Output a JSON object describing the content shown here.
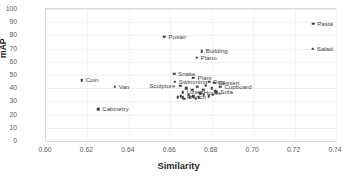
{
  "chart_data": {
    "type": "scatter",
    "title": "",
    "xlabel": "Similarity",
    "ylabel": "mAP",
    "xlim": [
      0.6,
      0.74
    ],
    "ylim": [
      0,
      100
    ],
    "xticks": [
      "0.60",
      "0.62",
      "0.64",
      "0.66",
      "0.68",
      "0.70",
      "0.72",
      "0.74"
    ],
    "xtick_values": [
      0.6,
      0.62,
      0.64,
      0.66,
      0.68,
      0.7,
      0.72,
      0.74
    ],
    "yticks": [
      "0",
      "10",
      "20",
      "30",
      "40",
      "50",
      "60",
      "70",
      "80",
      "90",
      "100"
    ],
    "ytick_values": [
      0,
      10,
      20,
      30,
      40,
      50,
      60,
      70,
      80,
      90,
      100
    ],
    "grid": true,
    "legend": "none",
    "marker_color": "#3f3f3f",
    "points": [
      {
        "label": "Pasta",
        "x": 0.729,
        "y": 89,
        "lx": 4,
        "ly": 0
      },
      {
        "label": "Salad",
        "x": 0.7288,
        "y": 70,
        "lx": 4,
        "ly": 0
      },
      {
        "label": "Poster",
        "x": 0.6572,
        "y": 79,
        "lx": 4,
        "ly": 0
      },
      {
        "label": "Building",
        "x": 0.6752,
        "y": 68,
        "lx": 4,
        "ly": 0
      },
      {
        "label": "Piano",
        "x": 0.6728,
        "y": 63,
        "lx": 4,
        "ly": 0
      },
      {
        "label": "Snake",
        "x": 0.6618,
        "y": 51,
        "lx": 4,
        "ly": 0
      },
      {
        "label": "Coin",
        "x": 0.6172,
        "y": 46,
        "lx": 4,
        "ly": 0
      },
      {
        "label": "Plant",
        "x": 0.6712,
        "y": 48,
        "lx": 4,
        "ly": 0
      },
      {
        "label": "Swimming",
        "x": 0.6622,
        "y": 45,
        "lx": 4,
        "ly": 0
      },
      {
        "label": "Dog",
        "x": 0.6788,
        "y": 45,
        "lx": 4,
        "ly": 0
      },
      {
        "label": "Dessert",
        "x": 0.6812,
        "y": 44,
        "lx": 4,
        "ly": 0
      },
      {
        "label": "Sculpture",
        "x": 0.6648,
        "y": 42,
        "lx": -31,
        "ly": 0
      },
      {
        "label": "Van",
        "x": 0.6332,
        "y": 41,
        "lx": 4,
        "ly": 0
      },
      {
        "label": "Cupboard",
        "x": 0.6842,
        "y": 41,
        "lx": 4,
        "ly": 0
      },
      {
        "label": "Lizard",
        "x": 0.666,
        "y": 37,
        "lx": 4,
        "ly": 0
      },
      {
        "label": "House",
        "x": 0.6742,
        "y": 36,
        "lx": 4,
        "ly": 0
      },
      {
        "label": "Sofa",
        "x": 0.6822,
        "y": 37,
        "lx": 4,
        "ly": 0
      },
      {
        "label": "French",
        "x": 0.666,
        "y": 33,
        "lx": 4,
        "ly": 0
      },
      {
        "label": "Cabinetry",
        "x": 0.6252,
        "y": 24,
        "lx": 4,
        "ly": 0
      },
      {
        "label": "",
        "x": 0.6678,
        "y": 40,
        "lx": 0,
        "ly": 0
      },
      {
        "label": "",
        "x": 0.6705,
        "y": 39,
        "lx": 0,
        "ly": 0
      },
      {
        "label": "",
        "x": 0.673,
        "y": 41,
        "lx": 0,
        "ly": 0
      },
      {
        "label": "",
        "x": 0.6758,
        "y": 39,
        "lx": 0,
        "ly": 0
      },
      {
        "label": "",
        "x": 0.6772,
        "y": 42,
        "lx": 0,
        "ly": 0
      },
      {
        "label": "",
        "x": 0.68,
        "y": 40,
        "lx": 0,
        "ly": 0
      },
      {
        "label": "",
        "x": 0.6816,
        "y": 38,
        "lx": 0,
        "ly": 0
      },
      {
        "label": "",
        "x": 0.6688,
        "y": 35,
        "lx": 0,
        "ly": 0
      },
      {
        "label": "",
        "x": 0.6712,
        "y": 34,
        "lx": 0,
        "ly": 0
      },
      {
        "label": "",
        "x": 0.6738,
        "y": 33,
        "lx": 0,
        "ly": 0
      },
      {
        "label": "",
        "x": 0.6762,
        "y": 35,
        "lx": 0,
        "ly": 0
      },
      {
        "label": "",
        "x": 0.6786,
        "y": 34,
        "lx": 0,
        "ly": 0
      },
      {
        "label": "",
        "x": 0.6806,
        "y": 35,
        "lx": 0,
        "ly": 0
      },
      {
        "label": "",
        "x": 0.6668,
        "y": 32,
        "lx": 0,
        "ly": 0
      },
      {
        "label": "",
        "x": 0.6694,
        "y": 33,
        "lx": 0,
        "ly": 0
      },
      {
        "label": "",
        "x": 0.6722,
        "y": 32,
        "lx": 0,
        "ly": 0
      },
      {
        "label": "",
        "x": 0.6748,
        "y": 36,
        "lx": 0,
        "ly": 0
      },
      {
        "label": "",
        "x": 0.665,
        "y": 34,
        "lx": 0,
        "ly": 0
      },
      {
        "label": "",
        "x": 0.6636,
        "y": 33,
        "lx": 0,
        "ly": 0
      }
    ]
  }
}
